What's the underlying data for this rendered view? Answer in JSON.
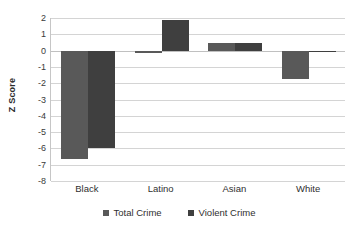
{
  "chart_data": {
    "type": "bar",
    "title": "",
    "subtitle": "",
    "xlabel": "",
    "ylabel": "Z Score",
    "categories": [
      "Black",
      "Latino",
      "Asian",
      "White"
    ],
    "series": [
      {
        "name": "Total Crime",
        "color": "#595959",
        "values": [
          -6.65,
          -0.12,
          0.45,
          -1.75
        ]
      },
      {
        "name": "Violent Crime",
        "color": "#3f3f3f",
        "values": [
          -5.95,
          1.85,
          0.47,
          -0.08
        ]
      }
    ],
    "ylim": [
      -8,
      2
    ],
    "y_ticks": [
      2,
      1,
      0,
      -1,
      -2,
      -3,
      -4,
      -5,
      -6,
      -7,
      -8
    ],
    "y_tick_labels": [
      "2",
      "1",
      "0",
      "-1",
      "-2",
      "-3",
      "-4",
      "-5",
      "-6",
      "-7",
      "-8"
    ],
    "grid": true,
    "grid_color": "#d4d4d4",
    "legend_position": "bottom",
    "legend_entries": [
      "Total Crime",
      "Violent Crime"
    ],
    "annotations": [],
    "background_color": "#ffffff"
  }
}
